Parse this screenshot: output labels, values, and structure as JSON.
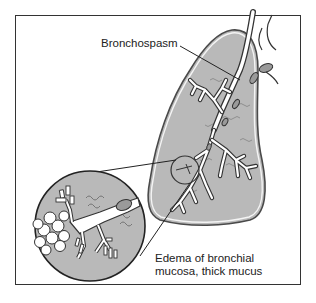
{
  "figure": {
    "type": "medical-illustration",
    "labels": {
      "bronchospasm": "Bronchospasm",
      "edema_line1": "Edema of bronchial",
      "edema_line2": "mucosa, thick mucus"
    },
    "elements": {
      "lung": "lung-lobe",
      "bronchial_tree": "bronchial-tree",
      "magnified_inset": "magnified-bronchiole-inset",
      "alveoli": "alveoli-cluster",
      "mucus": "mucus-plugs"
    },
    "colors": {
      "frame": "#333333",
      "lung_fill": "#b9b9b9",
      "lung_outline": "#4a4a4a",
      "airway_fill": "#ffffff",
      "ink": "#222222"
    }
  }
}
